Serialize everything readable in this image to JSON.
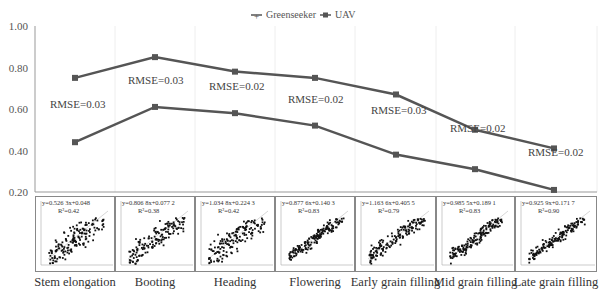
{
  "chart_data": {
    "type": "line",
    "title": "",
    "xlabel": "",
    "ylabel": "",
    "ylim": [
      0.2,
      1.0
    ],
    "yticks": [
      "1.00",
      "0.80",
      "0.60",
      "0.40",
      "0.20"
    ],
    "grid": "vertical light gridlines",
    "legend_position": "top-center",
    "categories": [
      "Stem elongation",
      "Booting",
      "Heading",
      "Flowering",
      "Early grain filling",
      "Mid grain filling",
      "Late grain filling"
    ],
    "series": [
      {
        "name": "Greenseeker",
        "marker": "plus",
        "values": [
          0.75,
          0.85,
          0.78,
          0.75,
          0.67,
          0.5,
          0.41
        ]
      },
      {
        "name": "UAV",
        "marker": "square",
        "values": [
          0.44,
          0.61,
          0.58,
          0.52,
          0.38,
          0.31,
          0.21
        ]
      }
    ],
    "annotations": [
      "RMSE=0.03",
      "RMSE=0.03",
      "RMSE=0.02",
      "RMSE=0.02",
      "RMSE=0.03",
      "RMSE=0.02",
      "RMSE=0.02"
    ],
    "inset_scatter_plots": [
      {
        "stage": "Stem elongation",
        "equation": "y=0.526 3x+0.048",
        "r2": "R²=0.42"
      },
      {
        "stage": "Booting",
        "equation": "y=0.806 8x+0.077 2",
        "r2": "R²=0.38"
      },
      {
        "stage": "Heading",
        "equation": "y=1.034 8x+0.224 3",
        "r2": "R²=0.42"
      },
      {
        "stage": "Flowering",
        "equation": "y=0.877 6x+0.140 3",
        "r2": "R²=0.83"
      },
      {
        "stage": "Early grain filling",
        "equation": "y=1.163 6x+0.405 5",
        "r2": "R²=0.79"
      },
      {
        "stage": "Mid grain filling",
        "equation": "y=0.985 5x+0.189 1",
        "r2": "R²=0.83"
      },
      {
        "stage": "Late grain filling",
        "equation": "y=0.925 9x+0.171 7",
        "r2": "R²=0.90"
      }
    ]
  },
  "colors": {
    "line": "#555555",
    "axis": "#999999",
    "grid": "#eeeeee"
  }
}
